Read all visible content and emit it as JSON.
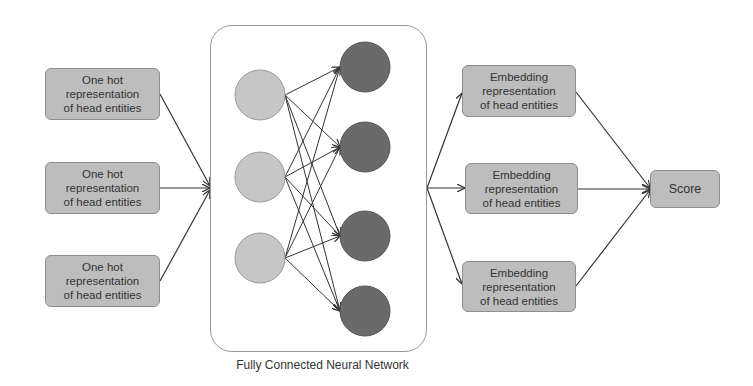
{
  "diagram": {
    "title": "Fully Connected Neural Network",
    "input_boxes": [
      {
        "label": "One hot\nrepresentation\nof head entities"
      },
      {
        "label": "One hot\nrepresentation\nof head entities"
      },
      {
        "label": "One hot\nrepresentation\nof head entities"
      }
    ],
    "network": {
      "caption": "Fully Connected Neural Network",
      "input_layer_nodes": 3,
      "output_layer_nodes": 4,
      "input_node_color": "#c6c6c6",
      "output_node_color": "#6a6a6a",
      "connectivity": "fully connected"
    },
    "embedding_boxes": [
      {
        "label": "Embedding\nrepresentation\nof head entities"
      },
      {
        "label": "Embedding\nrepresentation\nof head entities"
      },
      {
        "label": "Embedding\nrepresentation\nof head entities"
      }
    ],
    "output_box": {
      "label": "Score"
    },
    "colors": {
      "box_fill": "#bdbdbd",
      "box_border": "#8e8e8e",
      "arrow": "#333333",
      "frame_border": "#9a9a9a"
    }
  }
}
